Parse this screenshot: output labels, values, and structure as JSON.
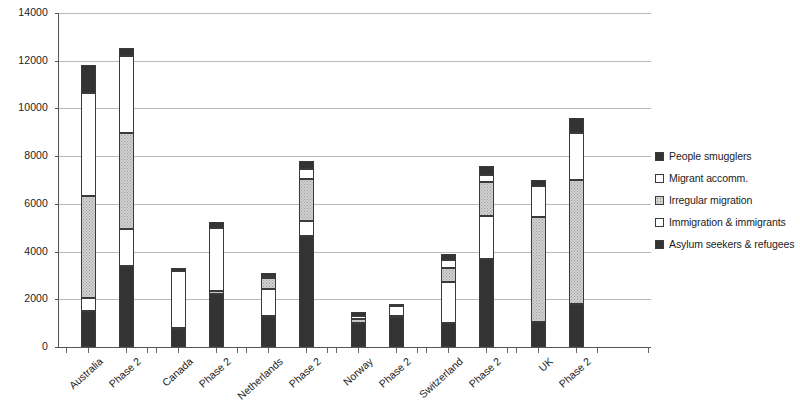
{
  "chart_data": {
    "type": "bar",
    "stacked": true,
    "title": "",
    "subtitle": "",
    "xlabel": "",
    "ylabel": "",
    "ylim": [
      0,
      14000
    ],
    "ytick_values": [
      0,
      2000,
      4000,
      6000,
      8000,
      10000,
      12000,
      14000
    ],
    "ytick_labels": [
      "0",
      "2000",
      "4000",
      "6000",
      "8000",
      "10000",
      "12000",
      "14000"
    ],
    "grid": true,
    "grid_axis": "y",
    "legend_position": "right",
    "categories": [
      "Australia",
      "Phase 2",
      "Canada",
      "Phase 2",
      "Netherlands",
      "Phase 2",
      "Norway",
      "Phase 2",
      "Switzerland",
      "Phase 2",
      "UK",
      "Phase 2"
    ],
    "groups": [
      {
        "country": "Australia",
        "bars": [
          "Australia",
          "Phase 2"
        ]
      },
      {
        "country": "Canada",
        "bars": [
          "Canada",
          "Phase 2"
        ]
      },
      {
        "country": "Netherlands",
        "bars": [
          "Netherlands",
          "Phase 2"
        ]
      },
      {
        "country": "Norway",
        "bars": [
          "Norway",
          "Phase 2"
        ]
      },
      {
        "country": "Switzerland",
        "bars": [
          "Switzerland",
          "Phase 2"
        ]
      },
      {
        "country": "UK",
        "bars": [
          "UK",
          "Phase 2"
        ]
      }
    ],
    "series": [
      {
        "name": "Asylum seekers & refugees",
        "fill": "dark",
        "color": "#333333",
        "values": [
          1500,
          3400,
          770,
          2220,
          1300,
          4650,
          1000,
          1250,
          1000,
          3700,
          1050,
          1800
        ]
      },
      {
        "name": "Immigration & immigrants",
        "fill": "white",
        "color": "#ffffff",
        "values": [
          570,
          1550,
          0,
          0,
          1120,
          650,
          0,
          0,
          1720,
          1800,
          0,
          0
        ]
      },
      {
        "name": "Irregular migration",
        "fill": "gray",
        "color": "#d2d2d2",
        "values": [
          4260,
          4000,
          30,
          120,
          480,
          1750,
          180,
          70,
          580,
          1400,
          4400,
          5200
        ]
      },
      {
        "name": "Migrant accomm.",
        "fill": "white",
        "color": "#ffffff",
        "values": [
          4300,
          3250,
          2400,
          2630,
          80,
          400,
          130,
          380,
          330,
          300,
          1300,
          1950
        ]
      },
      {
        "name": "People smugglers",
        "fill": "dark",
        "color": "#333333",
        "values": [
          1170,
          350,
          120,
          270,
          140,
          350,
          170,
          100,
          250,
          400,
          250,
          650
        ]
      }
    ],
    "bar_totals": [
      11800,
      12550,
      3320,
      5240,
      3120,
      7800,
      1480,
      1800,
      3880,
      7600,
      7000,
      10650
    ],
    "legend_entries": [
      "People smugglers",
      "Migrant accomm.",
      "Irregular migration",
      "Immigration & immigrants",
      "Asylum seekers & refugees"
    ],
    "legend_fills": [
      "dark",
      "white",
      "gray",
      "white",
      "dark"
    ]
  }
}
